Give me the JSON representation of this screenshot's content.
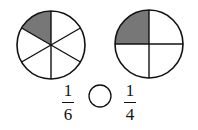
{
  "diagram": {
    "left_circle": {
      "parts": 6,
      "shaded": 1,
      "shade_color": "#777777"
    },
    "right_circle": {
      "parts": 4,
      "shaded": 1,
      "shade_color": "#777777"
    },
    "left_fraction": {
      "numerator": "1",
      "denominator": "6"
    },
    "right_fraction": {
      "numerator": "1",
      "denominator": "4"
    },
    "comparison_blank": ""
  }
}
